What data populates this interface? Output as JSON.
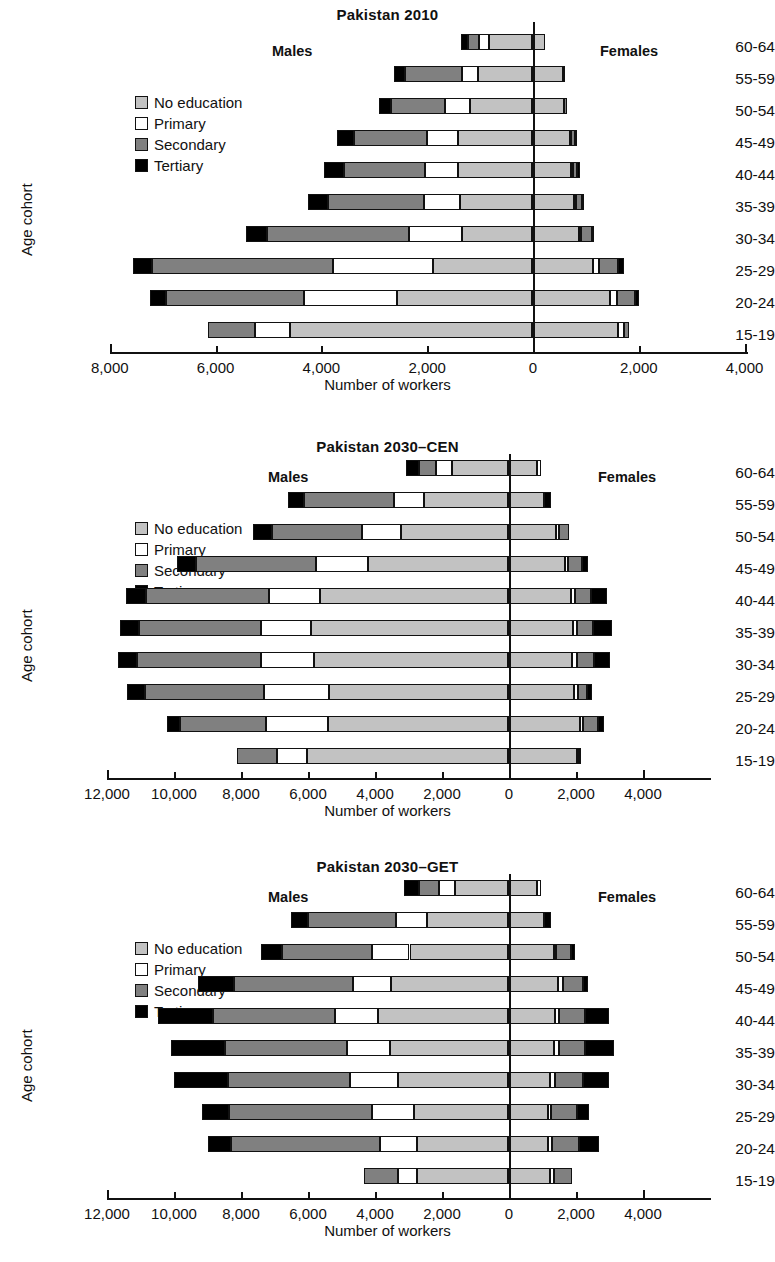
{
  "figure": {
    "axis_label_y": "Age cohort",
    "axis_label_x": "Number of workers",
    "males_label": "Males",
    "females_label": "Females",
    "legend": [
      {
        "key": "no_education",
        "label": "No education",
        "color": "#c2c2c2"
      },
      {
        "key": "primary",
        "label": "Primary",
        "color": "#ffffff"
      },
      {
        "key": "secondary",
        "label": "Secondary",
        "color": "#808080"
      },
      {
        "key": "tertiary",
        "label": "Tertiary",
        "color": "#000000"
      }
    ]
  },
  "chart_data": [
    {
      "type": "bar",
      "subtype": "population-pyramid-stacked",
      "title": "Pakistan 2010",
      "xlabel": "Number of workers",
      "ylabel": "Age cohort",
      "grid": false,
      "legend_position": "upper-left-inside",
      "xticks": [
        "8,000",
        "6,000",
        "4,000",
        "2,000",
        "0",
        "2,000",
        "4,000"
      ],
      "xtick_values": [
        -8000,
        -6000,
        -4000,
        -2000,
        0,
        2000,
        4000
      ],
      "xlim": [
        -8000,
        4000
      ],
      "categories": [
        "60-64",
        "55-59",
        "50-54",
        "45-49",
        "40-44",
        "35-39",
        "30-34",
        "25-29",
        "20-24",
        "15-19"
      ],
      "series_order": [
        "no_education",
        "primary",
        "secondary",
        "tertiary"
      ],
      "males": {
        "no_education": [
          820,
          1030,
          1180,
          1390,
          1400,
          1360,
          1330,
          1870,
          2550,
          4580
        ],
        "primary": [
          190,
          300,
          470,
          600,
          630,
          680,
          1000,
          1900,
          1760,
          650
        ],
        "secondary": [
          200,
          1080,
          1020,
          1370,
          1530,
          1810,
          2680,
          3420,
          2600,
          900
        ],
        "tertiary": [
          130,
          190,
          220,
          330,
          380,
          380,
          400,
          360,
          320,
          0
        ]
      },
      "females": {
        "no_education": [
          240,
          580,
          610,
          710,
          740,
          800,
          880,
          1150,
          1470,
          1630
        ],
        "primary": [
          0,
          0,
          0,
          30,
          30,
          40,
          50,
          110,
          130,
          100
        ],
        "secondary": [
          0,
          0,
          50,
          80,
          90,
          110,
          200,
          370,
          350,
          100
        ],
        "tertiary": [
          0,
          50,
          0,
          30,
          40,
          30,
          50,
          110,
          80,
          0
        ]
      }
    },
    {
      "type": "bar",
      "subtype": "population-pyramid-stacked",
      "title": "Pakistan 2030–CEN",
      "xlabel": "Number of workers",
      "ylabel": "Age cohort",
      "grid": false,
      "legend_position": "upper-left-inside",
      "xticks": [
        "12,000",
        "10,000",
        "8,000",
        "6,000",
        "4,000",
        "2,000",
        "0",
        "2,000",
        "4,000"
      ],
      "xtick_values": [
        -12000,
        -10000,
        -8000,
        -6000,
        -4000,
        -2000,
        0,
        2000,
        4000
      ],
      "xlim": [
        -12000,
        4000
      ],
      "categories": [
        "60-64",
        "55-59",
        "50-54",
        "45-49",
        "40-44",
        "35-39",
        "30-34",
        "25-29",
        "20-24",
        "15-19"
      ],
      "series_order": [
        "no_education",
        "primary",
        "secondary",
        "tertiary"
      ],
      "males": {
        "no_education": [
          1680,
          2500,
          3180,
          4180,
          5600,
          5880,
          5800,
          5350,
          5370,
          6000
        ],
        "primary": [
          480,
          900,
          1180,
          1560,
          1540,
          1480,
          1580,
          1930,
          1840,
          900
        ],
        "secondary": [
          500,
          2680,
          2680,
          3560,
          3670,
          3660,
          3680,
          3560,
          2580,
          1200
        ],
        "tertiary": [
          390,
          500,
          560,
          570,
          580,
          570,
          580,
          530,
          380,
          0
        ]
      },
      "females": {
        "no_education": [
          860,
          1080,
          1440,
          1700,
          1880,
          1930,
          1920,
          1980,
          2140,
          2050
        ],
        "primary": [
          120,
          0,
          70,
          90,
          110,
          120,
          130,
          110,
          90,
          60
        ],
        "secondary": [
          0,
          0,
          300,
          430,
          480,
          500,
          530,
          280,
          470,
          80
        ],
        "tertiary": [
          0,
          200,
          0,
          160,
          490,
          560,
          470,
          130,
          180,
          0
        ]
      }
    },
    {
      "type": "bar",
      "subtype": "population-pyramid-stacked",
      "title": "Pakistan 2030–GET",
      "xlabel": "Number of workers",
      "ylabel": "Age cohort",
      "grid": false,
      "legend_position": "upper-left-inside",
      "xticks": [
        "12,000",
        "10,000",
        "8,000",
        "6,000",
        "4,000",
        "2,000",
        "0",
        "2,000",
        "4,000"
      ],
      "xtick_values": [
        -12000,
        -10000,
        -8000,
        -6000,
        -4000,
        -2000,
        0,
        2000,
        4000
      ],
      "xlim": [
        -12000,
        4000
      ],
      "categories": [
        "60-64",
        "55-59",
        "50-54",
        "45-49",
        "40-44",
        "35-39",
        "30-34",
        "25-29",
        "20-24",
        "15-19"
      ],
      "series_order": [
        "no_education",
        "primary",
        "secondary",
        "tertiary"
      ],
      "males": {
        "no_education": [
          1590,
          2430,
          2940,
          3500,
          3870,
          3520,
          3270,
          2800,
          2720,
          2730
        ],
        "primary": [
          480,
          900,
          1130,
          1130,
          1280,
          1280,
          1460,
          1260,
          1090,
          540
        ],
        "secondary": [
          600,
          2640,
          2690,
          3550,
          3660,
          3640,
          3630,
          4280,
          4470,
          1030
        ],
        "tertiary": [
          420,
          520,
          600,
          1070,
          1630,
          1620,
          1600,
          790,
          670,
          0
        ]
      },
      "females": {
        "no_education": [
          880,
          1080,
          1360,
          1480,
          1400,
          1370,
          1250,
          1180,
          1180,
          1240
        ],
        "primary": [
          110,
          0,
          80,
          150,
          130,
          140,
          140,
          110,
          130,
          120
        ],
        "secondary": [
          0,
          0,
          430,
          600,
          760,
          800,
          850,
          780,
          810,
          540
        ],
        "tertiary": [
          0,
          200,
          120,
          160,
          720,
          840,
          780,
          360,
          600,
          0
        ]
      }
    }
  ]
}
